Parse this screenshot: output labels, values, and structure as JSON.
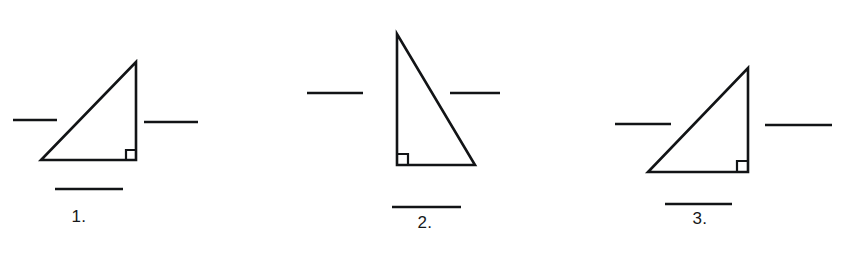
{
  "worksheet": {
    "title": "Right triangle labeling exercise",
    "background_color": "#ffffff",
    "ink_color": "#121416",
    "figures": [
      {
        "label": "1.",
        "name": "figure-1",
        "triangle": {
          "points": "41,160 136,160 136,62",
          "right_angle_corner": "bottom-right",
          "right_angle_marker": "136,150 126,150 126,160",
          "vertices": [
            {
              "x": 41,
              "y": 160
            },
            {
              "x": 136,
              "y": 160
            },
            {
              "x": 136,
              "y": 62
            }
          ]
        },
        "blanks": [
          {
            "name": "blank-left",
            "x1": 13,
            "y1": 120,
            "x2": 57,
            "y2": 120
          },
          {
            "name": "blank-right",
            "x1": 144,
            "y1": 122,
            "x2": 198,
            "y2": 122
          },
          {
            "name": "blank-bottom",
            "x1": 55,
            "y1": 189,
            "x2": 123,
            "y2": 189
          }
        ],
        "label_position": {
          "x": 79,
          "y": 208
        }
      },
      {
        "label": "2.",
        "name": "figure-2",
        "triangle": {
          "points": "397,34 397,165 475,165",
          "right_angle_corner": "bottom-left",
          "right_angle_marker": "397,154 408,154 408,165",
          "vertices": [
            {
              "x": 397,
              "y": 34
            },
            {
              "x": 397,
              "y": 165
            },
            {
              "x": 475,
              "y": 165
            }
          ]
        },
        "blanks": [
          {
            "name": "blank-left",
            "x1": 307,
            "y1": 93,
            "x2": 363,
            "y2": 93
          },
          {
            "name": "blank-right",
            "x1": 450,
            "y1": 93,
            "x2": 500,
            "y2": 93
          },
          {
            "name": "blank-bottom",
            "x1": 392,
            "y1": 207,
            "x2": 461,
            "y2": 207
          }
        ],
        "label_position": {
          "x": 425,
          "y": 214
        }
      },
      {
        "label": "3.",
        "name": "figure-3",
        "triangle": {
          "points": "648,172 748,172 748,68",
          "right_angle_corner": "bottom-right",
          "right_angle_marker": "748,161 737,161 737,172",
          "vertices": [
            {
              "x": 648,
              "y": 172
            },
            {
              "x": 748,
              "y": 172
            },
            {
              "x": 748,
              "y": 68
            }
          ]
        },
        "blanks": [
          {
            "name": "blank-left",
            "x1": 615,
            "y1": 124,
            "x2": 671,
            "y2": 124
          },
          {
            "name": "blank-right",
            "x1": 765,
            "y1": 125,
            "x2": 832,
            "y2": 125
          },
          {
            "name": "blank-bottom",
            "x1": 665,
            "y1": 204,
            "x2": 732,
            "y2": 204
          }
        ],
        "label_position": {
          "x": 700,
          "y": 210
        }
      }
    ]
  }
}
